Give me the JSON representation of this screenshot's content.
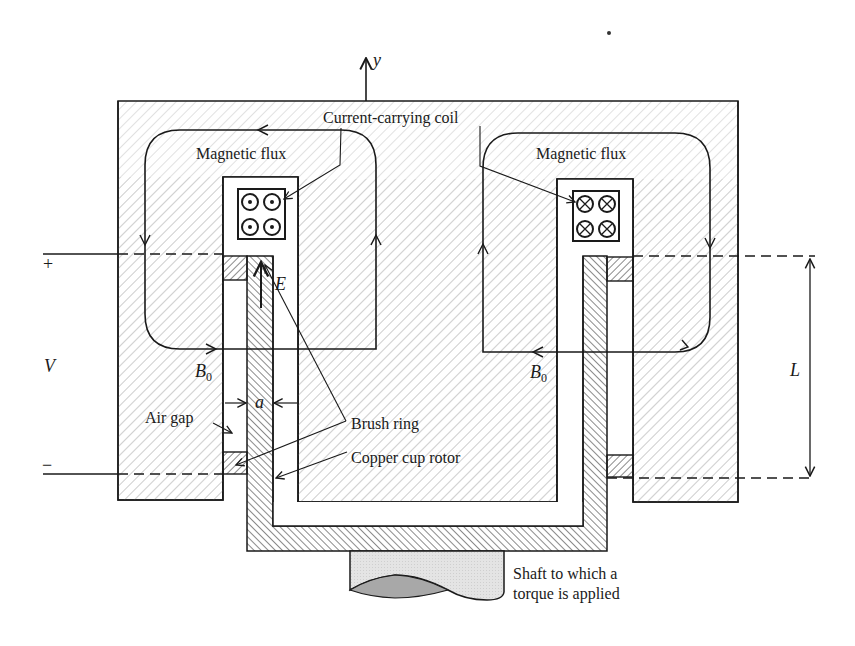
{
  "figure": {
    "type": "cross-section diagram"
  },
  "labels": {
    "axis_y": "y",
    "coil": "Current-carrying coil",
    "flux_left": "Magnetic flux",
    "flux_right": "Magnetic flux",
    "field_left": "B",
    "field_left_sub": "0",
    "field_right": "B",
    "field_right_sub": "0",
    "efield": "E",
    "gap_dim": "a",
    "air_gap": "Air gap",
    "brush_ring": "Brush ring",
    "rotor": "Copper cup rotor",
    "shaft_line1": "Shaft to which a",
    "shaft_line2": "torque is applied",
    "voltage": "V",
    "plus": "+",
    "minus": "−",
    "length": "L"
  },
  "coils": {
    "left_symbol": "dot (current out of page)",
    "right_symbol": "cross (current into page)",
    "count_per_side": 4
  },
  "colors": {
    "ink": "#1a1a1a",
    "core_hatch": "#bdbdbd",
    "rotor_hatch": "#2a2a2a",
    "shaft_fill": "#e2e2e2",
    "shaft_end": "#a8a8a8"
  }
}
